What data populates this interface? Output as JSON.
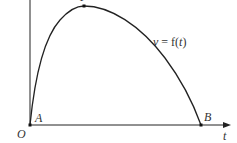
{
  "diagram": {
    "type": "velocity-time graph",
    "curve_label": {
      "v": "v",
      "eq": " = ",
      "f": "f(",
      "t": "t",
      "close": ")"
    },
    "axes": {
      "origin_label": "O",
      "x_axis_label": "t"
    },
    "points": {
      "A": "A",
      "B": "B",
      "P": "P"
    },
    "colors": {
      "stroke": "#222222",
      "text": "#333333",
      "background": "#ffffff"
    }
  }
}
